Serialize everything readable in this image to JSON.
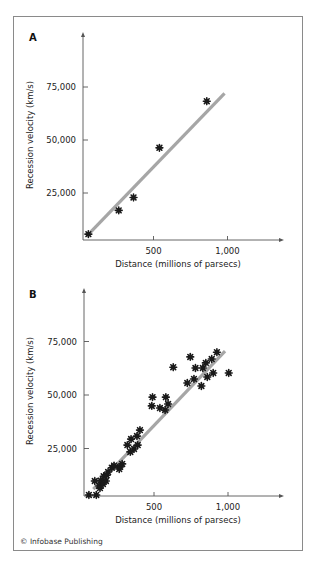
{
  "figure": {
    "credit": "© Infobase Publishing",
    "frame_color": "#8a8a8a",
    "point_color": "#1a1a1a",
    "fit_line_color": "#a6a6a6",
    "axis_color": "#555555"
  },
  "chart_data": [
    {
      "panel": "A",
      "type": "scatter",
      "title": "A",
      "xlabel": "Distance (millions of parsecs)",
      "ylabel": "Recession velocity (km/s)",
      "x_ticks": [
        500,
        1000
      ],
      "x_tick_labels": [
        "500",
        "1,000"
      ],
      "y_ticks": [
        25000,
        50000,
        75000
      ],
      "y_tick_labels": [
        "25,000",
        "50,000",
        "75,000"
      ],
      "xlim": [
        0,
        1380
      ],
      "ylim": [
        0,
        100000
      ],
      "grid": false,
      "legend": null,
      "points": [
        {
          "x": 60,
          "y": 5600
        },
        {
          "x": 265,
          "y": 16800
        },
        {
          "x": 365,
          "y": 22900
        },
        {
          "x": 540,
          "y": 46300
        },
        {
          "x": 860,
          "y": 68300
        }
      ],
      "fit_line": {
        "x": [
          75,
          980
        ],
        "y": [
          6500,
          72000
        ]
      }
    },
    {
      "panel": "B",
      "type": "scatter",
      "title": "B",
      "xlabel": "Distance (millions of parsecs)",
      "ylabel": "Recession velocity (km/s)",
      "x_ticks": [
        500,
        1000
      ],
      "x_tick_labels": [
        "500",
        "1,000"
      ],
      "y_ticks": [
        25000,
        50000,
        75000
      ],
      "y_tick_labels": [
        "25,000",
        "50,000",
        "75,000"
      ],
      "xlim": [
        0,
        1380
      ],
      "ylim": [
        0,
        100000
      ],
      "grid": false,
      "legend": null,
      "points": [
        {
          "x": 60,
          "y": 3300
        },
        {
          "x": 110,
          "y": 3300
        },
        {
          "x": 130,
          "y": 7500
        },
        {
          "x": 100,
          "y": 9800
        },
        {
          "x": 140,
          "y": 10000
        },
        {
          "x": 160,
          "y": 12000
        },
        {
          "x": 180,
          "y": 12500
        },
        {
          "x": 135,
          "y": 6500
        },
        {
          "x": 155,
          "y": 8400
        },
        {
          "x": 175,
          "y": 9800
        },
        {
          "x": 190,
          "y": 14000
        },
        {
          "x": 215,
          "y": 16000
        },
        {
          "x": 230,
          "y": 17000
        },
        {
          "x": 265,
          "y": 15400
        },
        {
          "x": 270,
          "y": 16400
        },
        {
          "x": 285,
          "y": 17800
        },
        {
          "x": 320,
          "y": 26600
        },
        {
          "x": 340,
          "y": 23400
        },
        {
          "x": 345,
          "y": 29400
        },
        {
          "x": 365,
          "y": 24800
        },
        {
          "x": 385,
          "y": 30800
        },
        {
          "x": 390,
          "y": 26600
        },
        {
          "x": 405,
          "y": 33600
        },
        {
          "x": 485,
          "y": 44900
        },
        {
          "x": 490,
          "y": 49000
        },
        {
          "x": 540,
          "y": 43900
        },
        {
          "x": 575,
          "y": 43000
        },
        {
          "x": 580,
          "y": 49000
        },
        {
          "x": 595,
          "y": 45800
        },
        {
          "x": 630,
          "y": 63000
        },
        {
          "x": 725,
          "y": 55600
        },
        {
          "x": 745,
          "y": 67800
        },
        {
          "x": 770,
          "y": 57500
        },
        {
          "x": 780,
          "y": 62600
        },
        {
          "x": 820,
          "y": 54200
        },
        {
          "x": 830,
          "y": 62600
        },
        {
          "x": 850,
          "y": 65000
        },
        {
          "x": 860,
          "y": 58400
        },
        {
          "x": 890,
          "y": 66800
        },
        {
          "x": 900,
          "y": 60300
        },
        {
          "x": 925,
          "y": 70000
        },
        {
          "x": 1005,
          "y": 60300
        }
      ],
      "fit_line": {
        "x": [
          90,
          980
        ],
        "y": [
          6000,
          70500
        ]
      }
    }
  ]
}
